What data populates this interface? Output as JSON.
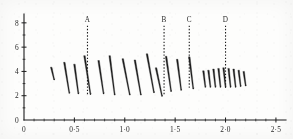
{
  "figure": {
    "title": "",
    "background_color": "#fdfdfc",
    "ink_color": "#1c1c1c"
  },
  "chart_data": {
    "type": "line",
    "title": "",
    "xlabel": "",
    "ylabel": "",
    "xlim": [
      0,
      2.6
    ],
    "ylim": [
      0,
      8.4
    ],
    "grid": false,
    "legend": null,
    "x_ticks": [
      0,
      0.5,
      1.0,
      1.5,
      2.0,
      2.5
    ],
    "x_tick_labels": [
      "0",
      "0·5",
      "1·0",
      "1·5",
      "2·0",
      "2·5"
    ],
    "x_minor_ticks": [
      0.1,
      0.2,
      0.3,
      0.4,
      0.6,
      0.7,
      0.8,
      0.9,
      1.1,
      1.2,
      1.3,
      1.4,
      1.6,
      1.7,
      1.8,
      1.9,
      2.1,
      2.2,
      2.3,
      2.4
    ],
    "y_ticks": [
      0,
      2,
      4,
      6,
      8
    ],
    "y_tick_labels": [
      "0",
      "2",
      "4",
      "6",
      "8"
    ],
    "y_minor_ticks": [
      1,
      3,
      5,
      7
    ],
    "annotations": [
      {
        "label": "A",
        "x": 0.63,
        "y_top": 8.1,
        "y_bottom": 2.0,
        "style": "dotted-vertical"
      },
      {
        "label": "B",
        "x": 1.39,
        "y_top": 8.1,
        "y_bottom": 2.0,
        "style": "dotted-vertical"
      },
      {
        "label": "C",
        "x": 1.64,
        "y_top": 8.1,
        "y_bottom": 2.5,
        "style": "dotted-vertical"
      },
      {
        "label": "D",
        "x": 2.0,
        "y_top": 8.1,
        "y_bottom": 2.6,
        "style": "dotted-vertical"
      }
    ],
    "series": [
      {
        "name": "relaxation-traces",
        "description": "sawtooth relaxation strokes: each stroke rises to a peak then decays",
        "strokes": [
          {
            "x0": 0.27,
            "y0": 4.35,
            "x1": 0.3,
            "y1": 3.3
          },
          {
            "x0": 0.4,
            "y0": 4.75,
            "x1": 0.45,
            "y1": 2.2
          },
          {
            "x0": 0.5,
            "y0": 4.6,
            "x1": 0.54,
            "y1": 2.15
          },
          {
            "x0": 0.6,
            "y0": 5.3,
            "x1": 0.66,
            "y1": 2.1
          },
          {
            "x0": 0.74,
            "y0": 4.9,
            "x1": 0.79,
            "y1": 2.15
          },
          {
            "x0": 0.85,
            "y0": 5.3,
            "x1": 0.9,
            "y1": 2.05
          },
          {
            "x0": 0.98,
            "y0": 5.05,
            "x1": 1.05,
            "y1": 2.05
          },
          {
            "x0": 1.1,
            "y0": 4.95,
            "x1": 1.16,
            "y1": 2.05
          },
          {
            "x0": 1.22,
            "y0": 5.45,
            "x1": 1.29,
            "y1": 2.25
          },
          {
            "x0": 1.31,
            "y0": 4.3,
            "x1": 1.37,
            "y1": 1.95
          },
          {
            "x0": 1.41,
            "y0": 5.25,
            "x1": 1.46,
            "y1": 2.35
          },
          {
            "x0": 1.52,
            "y0": 5.0,
            "x1": 1.56,
            "y1": 2.45
          },
          {
            "x0": 1.64,
            "y0": 5.2,
            "x1": 1.68,
            "y1": 2.55
          },
          {
            "x0": 1.78,
            "y0": 4.05,
            "x1": 1.8,
            "y1": 2.7
          },
          {
            "x0": 1.83,
            "y0": 4.1,
            "x1": 1.85,
            "y1": 2.7
          },
          {
            "x0": 1.88,
            "y0": 4.2,
            "x1": 1.9,
            "y1": 2.7
          },
          {
            "x0": 1.93,
            "y0": 4.25,
            "x1": 1.95,
            "y1": 2.7
          },
          {
            "x0": 1.98,
            "y0": 4.3,
            "x1": 2.0,
            "y1": 2.7
          },
          {
            "x0": 2.03,
            "y0": 4.25,
            "x1": 2.05,
            "y1": 2.7
          },
          {
            "x0": 2.08,
            "y0": 4.2,
            "x1": 2.1,
            "y1": 2.7
          },
          {
            "x0": 2.13,
            "y0": 4.1,
            "x1": 2.15,
            "y1": 2.75
          },
          {
            "x0": 2.18,
            "y0": 4.0,
            "x1": 2.2,
            "y1": 2.8
          }
        ]
      }
    ]
  }
}
